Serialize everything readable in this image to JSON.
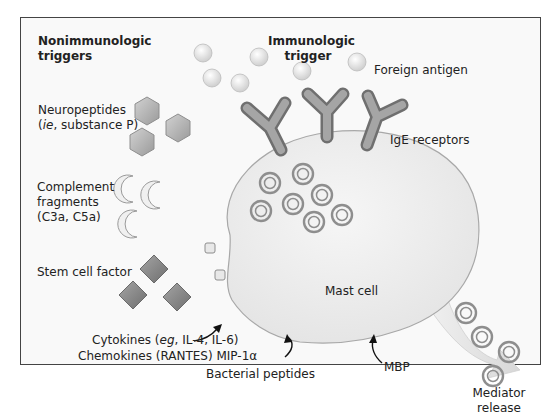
{
  "diagram": {
    "title_left": {
      "line1": "Nonimmunologic",
      "line2": "triggers"
    },
    "title_right": {
      "line1": "Immunologic",
      "line2": "trigger"
    },
    "labels": {
      "foreign_antigen": "Foreign antigen",
      "ige_receptors": "IgE receptors",
      "neuropeptides": {
        "line1": "Neuropeptides",
        "line2_italic": "ie",
        "line2_rest": ", substance P)",
        "line2_prefix": "("
      },
      "complement": {
        "line1": "Complement",
        "line2": "fragments",
        "line3": "(C3a, C5a)"
      },
      "stem_cell_factor": "Stem cell factor",
      "cytokines": {
        "prefix": "Cytokines (",
        "italic": "eg",
        "rest": ", IL-4, IL-6)"
      },
      "chemokines": "Chemokines (RANTES) MIP-1α",
      "bacterial_peptides": "Bacterial peptides",
      "mbp": "MBP",
      "mast_cell": "Mast cell",
      "mediator_release": {
        "line1": "Mediator",
        "line2": "release"
      }
    },
    "colors": {
      "frame_border": "#444444",
      "background": "#f9f9f9",
      "cell_fill": "#ececec",
      "cell_stroke": "#a8a8a8",
      "receptor": "#8c8c8c",
      "granule": "#999999",
      "antigen": "#dcdcdc",
      "hexagon": "#b5b5b5",
      "diamond": "#8a8a8a",
      "arrow_fill": "#e0e0e0"
    }
  }
}
